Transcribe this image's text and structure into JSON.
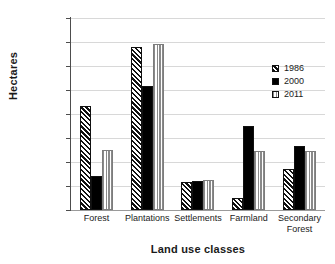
{
  "chart_data": {
    "type": "bar",
    "title": "",
    "xlabel": "Land use classes",
    "ylabel": "Hectares",
    "categories": [
      "Forest",
      "Plantations",
      "Settlements",
      "Farmland",
      "Secondary Forest"
    ],
    "series": [
      {
        "name": "1986",
        "pattern": "diagonal-hatch",
        "color": "#000000",
        "values": [
          43500,
          68000,
          11700,
          4900,
          17200
        ]
      },
      {
        "name": "2000",
        "pattern": "solid-black",
        "color": "#000000",
        "values": [
          14000,
          51800,
          12000,
          35000,
          26700
        ]
      },
      {
        "name": "2011",
        "pattern": "vertical-stripes",
        "color": "#8a8a8a",
        "values": [
          24800,
          69000,
          12300,
          24400,
          24400
        ]
      }
    ],
    "ylim": [
      0,
      80000
    ],
    "ytick_labels": [
      "80000",
      "70000",
      "60000",
      "50000",
      "40000",
      "30000",
      "20000",
      "10000",
      "0"
    ],
    "ytick_values": [
      80000,
      70000,
      60000,
      50000,
      40000,
      30000,
      20000,
      10000,
      0
    ],
    "grid": true,
    "legend_position": "upper-right"
  }
}
